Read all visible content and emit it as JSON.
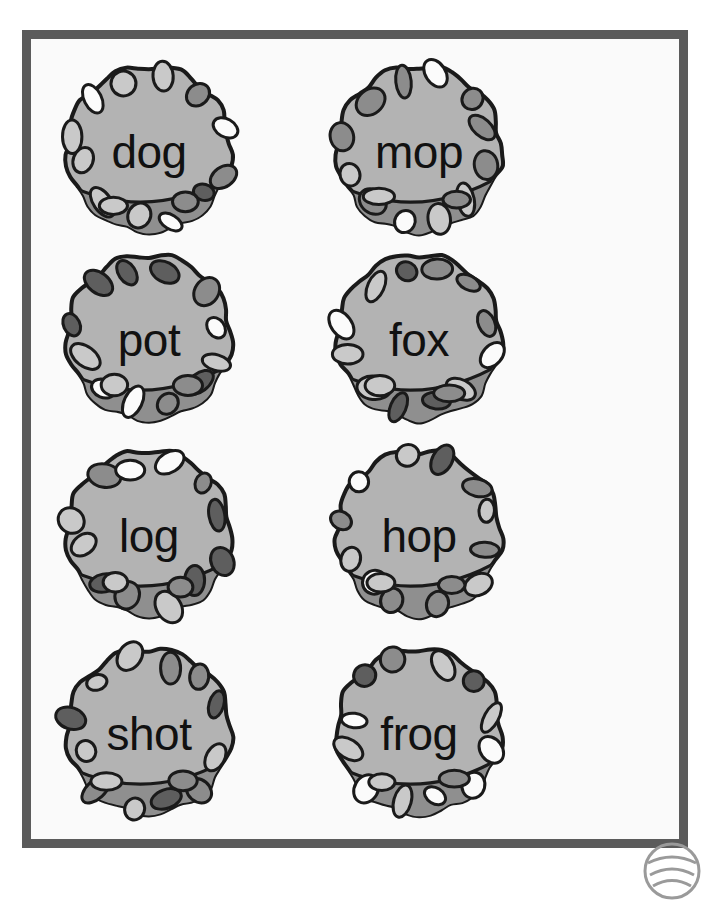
{
  "page": {
    "background_color": "#ffffff",
    "width": 708,
    "height": 879
  },
  "worksheet": {
    "frame_color": "#5b5b5b",
    "paper_color": "#fafafa",
    "title": ""
  },
  "palette": {
    "ball_body": "#b3b3b3",
    "ball_rim_shadow": "#8f8f8f",
    "crater_dark": "#5e5e5e",
    "crater_medium": "#8c8c8c",
    "crater_light": "#c9c9c9",
    "crater_white": "#fbfbfb",
    "outline": "#1a1a1a",
    "text": "#111111"
  },
  "balls": [
    {
      "word": "dog",
      "row": 0,
      "col": 0,
      "name": "ball-dog"
    },
    {
      "word": "mop",
      "row": 0,
      "col": 1,
      "name": "ball-mop"
    },
    {
      "word": "pot",
      "row": 1,
      "col": 0,
      "name": "ball-pot"
    },
    {
      "word": "fox",
      "row": 1,
      "col": 1,
      "name": "ball-fox"
    },
    {
      "word": "log",
      "row": 2,
      "col": 0,
      "name": "ball-log"
    },
    {
      "word": "hop",
      "row": 2,
      "col": 1,
      "name": "ball-hop"
    },
    {
      "word": "shot",
      "row": 3,
      "col": 0,
      "name": "ball-shot"
    },
    {
      "word": "frog",
      "row": 3,
      "col": 1,
      "name": "ball-frog"
    }
  ],
  "corner_logo": {
    "name": "watermark-logo",
    "shape": "circle-partial",
    "color": "#8c8c8c"
  }
}
